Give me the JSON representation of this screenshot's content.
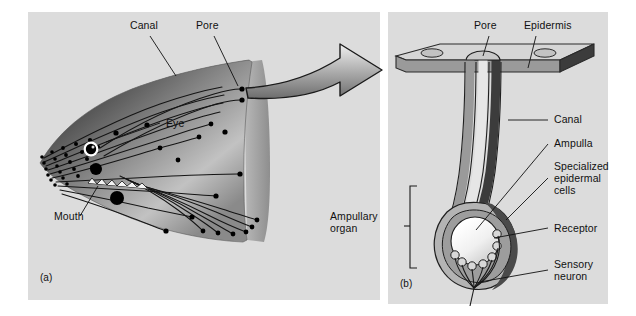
{
  "figure": {
    "background_color": "#dcdcdc",
    "page_color": "#ffffff"
  },
  "panel_a": {
    "id": "(a)",
    "description": "Lateral view of shark head showing subdermal canals radiating from pores",
    "labels": [
      {
        "name": "canal",
        "text": "Canal",
        "x": 132,
        "y": 26
      },
      {
        "name": "pore",
        "text": "Pore",
        "x": 196,
        "y": 26
      },
      {
        "name": "eye",
        "text": "Eye",
        "x": 164,
        "y": 120
      },
      {
        "name": "mouth",
        "text": "Mouth",
        "x": 56,
        "y": 222
      }
    ]
  },
  "panel_b": {
    "id": "(b)",
    "description": "Cross-section of a single ampullary organ beneath the epidermis",
    "labels": [
      {
        "name": "pore",
        "text": "Pore",
        "x": 480,
        "y": 24
      },
      {
        "name": "epidermis",
        "text": "Epidermis",
        "x": 524,
        "y": 24
      },
      {
        "name": "canal",
        "text": "Canal",
        "x": 553,
        "y": 117
      },
      {
        "name": "ampulla",
        "text": "Ampulla",
        "x": 553,
        "y": 140
      },
      {
        "name": "specialized-epidermal-cells",
        "text": "Specialized\nepidermal\ncells",
        "x": 553,
        "y": 163
      },
      {
        "name": "receptor",
        "text": "Receptor",
        "x": 553,
        "y": 225
      },
      {
        "name": "sensory-neuron",
        "text": "Sensory\nneuron",
        "x": 553,
        "y": 262
      },
      {
        "name": "ampullary-organ",
        "text": "Ampullary\norgan",
        "x": 386,
        "y": 216
      }
    ]
  },
  "colors": {
    "skin_dark": "#4a4a4a",
    "skin_mid": "#7d7d7d",
    "skin_light": "#c9c9c9",
    "canal_line": "#1a1a1a",
    "pore_dot": "#000000",
    "epidermis_top": "#d2d2d2",
    "epidermis_edge": "#8d8d8d",
    "epidermis_dark": "#3c3c3c",
    "canal_wall": "#9a9a9a",
    "canal_outer": "#4a4a4a",
    "ampulla_fill": "#f2f2f2",
    "label_text": "#111111",
    "background": "#dcdcdc"
  }
}
